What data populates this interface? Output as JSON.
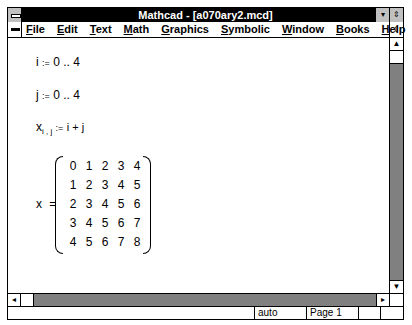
{
  "window": {
    "title": "Mathcad - [a070ary2.mcd]"
  },
  "titlebar_buttons": {
    "minimize_icon": "▾",
    "restore_icon": "⇕"
  },
  "menubar": {
    "items": [
      {
        "label": "File",
        "accel": "F"
      },
      {
        "label": "Edit",
        "accel": "E"
      },
      {
        "label": "Text",
        "accel": "T"
      },
      {
        "label": "Math",
        "accel": "M"
      },
      {
        "label": "Graphics",
        "accel": "G"
      },
      {
        "label": "Symbolic",
        "accel": "S"
      },
      {
        "label": "Window",
        "accel": "W"
      },
      {
        "label": "Books",
        "accel": "B"
      },
      {
        "label": "Help",
        "accel": "H"
      }
    ],
    "doc_restore_icon": "⇕"
  },
  "worksheet": {
    "range_i": {
      "var": "i",
      "op": ":=",
      "expr": "0 .. 4"
    },
    "range_j": {
      "var": "j",
      "op": ":=",
      "expr": "0 .. 4"
    },
    "def_x": {
      "var": "x",
      "sub": "i , j",
      "op": ":=",
      "expr": "i + j"
    },
    "result": {
      "var": "x",
      "op": "=",
      "matrix": [
        [
          0,
          1,
          2,
          3,
          4
        ],
        [
          1,
          2,
          3,
          4,
          5
        ],
        [
          2,
          3,
          4,
          5,
          6
        ],
        [
          3,
          4,
          5,
          6,
          7
        ],
        [
          4,
          5,
          6,
          7,
          8
        ]
      ]
    }
  },
  "scrollbars": {
    "up_icon": "▲",
    "down_icon": "▼",
    "left_icon": "◂",
    "right_icon": "▸"
  },
  "statusbar": {
    "mode": "auto",
    "page": "Page 1"
  }
}
